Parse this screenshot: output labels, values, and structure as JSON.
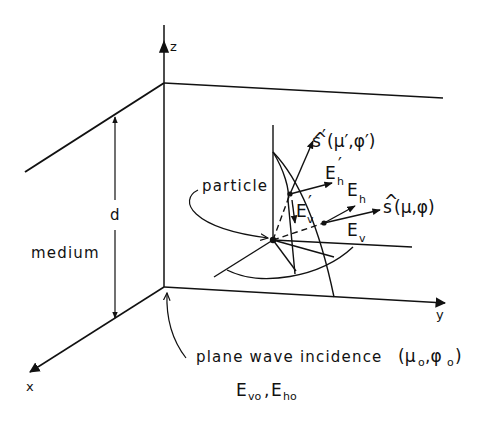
{
  "diagram": {
    "title": "",
    "colors": {
      "ink": "#111111",
      "background": "#ffffff"
    },
    "axes": {
      "z": {
        "label": "z"
      },
      "x": {
        "label": "x"
      },
      "y": {
        "label": "y"
      }
    },
    "labels": {
      "depth": "d",
      "medium": "medium",
      "particle": "particle",
      "incidence_text": "plane wave incidence",
      "incidence_angles": "(μ",
      "incidence_mu_sub": "o",
      "incidence_comma": ",φ",
      "incidence_phi_sub": "o",
      "incidence_close": ")",
      "incident_fields": {
        "ev": "E",
        "ev_sub": "vo",
        "sep": ",",
        "eh": "E",
        "eh_sub": "ho"
      },
      "scattered_direction": {
        "hat": "^",
        "base": "s",
        "args": "(μ,φ)"
      },
      "incident_direction_prime": {
        "hat": "^",
        "base": "s",
        "prime": "′",
        "args": "(μ′,φ′)"
      },
      "E_h": {
        "base": "E",
        "sub": "h"
      },
      "E_v": {
        "base": "E",
        "sub": "v"
      },
      "E_h_prime": {
        "base": "E",
        "sub": "h",
        "prime": "′"
      },
      "E_v_prime": {
        "base": "E",
        "sub": "v",
        "prime": "′"
      }
    }
  }
}
